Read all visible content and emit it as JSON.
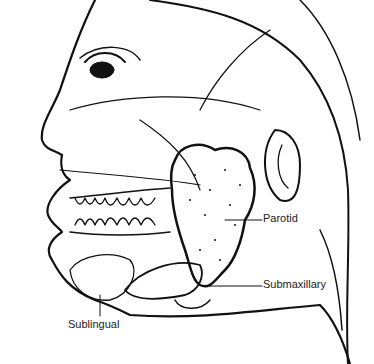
{
  "diagram": {
    "labels": {
      "parotid": "Parotid",
      "submaxillary": "Submaxillary",
      "sublingual": "Sublingual"
    }
  }
}
